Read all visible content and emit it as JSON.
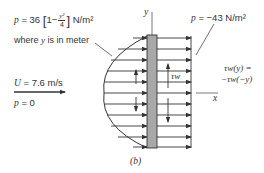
{
  "figure": {
    "caption": "(b)",
    "left_pressure": {
      "p_symbol": "p",
      "equals": " = 36 ",
      "one_minus": "1−",
      "frac_num": "y²",
      "frac_den": "4",
      "units": " N/m²",
      "note_prefix": "where ",
      "note_var": "y",
      "note_suffix": " is in meter"
    },
    "right_pressure": {
      "p_symbol": "p",
      "text": " = −43 N/m²"
    },
    "free_stream": {
      "velocity_var": "U",
      "velocity_text": " = 7.6 m/s",
      "pressure_var": "p",
      "pressure_text": " = 0"
    },
    "shear_label": "τw",
    "symmetry_line1": "τw(y) =",
    "symmetry_line2": "−τw(−y)",
    "axis_x": "x",
    "axis_y": "y"
  },
  "colors": {
    "ink": "#333333",
    "plate": "#a8a8a8"
  }
}
